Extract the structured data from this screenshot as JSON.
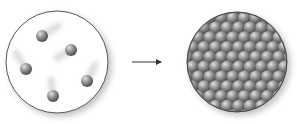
{
  "diagram": {
    "type": "state-transition",
    "colors": {
      "background": "#ffffff",
      "circle_stroke": "#555555",
      "circle_fill_left": "#ffffff",
      "circle_fill_right": "#6f6f6f",
      "particle": "#8a8a8a",
      "arrow": "#333333"
    },
    "left_panel": {
      "label": "",
      "cx": 57,
      "cy": 62,
      "r": 51,
      "particles": [
        {
          "x": 42,
          "y": 36,
          "trail_dx": 16,
          "trail_dy": -10
        },
        {
          "x": 71,
          "y": 50,
          "trail_dx": -14,
          "trail_dy": 8
        },
        {
          "x": 26,
          "y": 69,
          "trail_dx": -10,
          "trail_dy": -16
        },
        {
          "x": 87,
          "y": 81,
          "trail_dx": 8,
          "trail_dy": -16
        },
        {
          "x": 53,
          "y": 96,
          "trail_dx": -2,
          "trail_dy": -16
        }
      ]
    },
    "arrow": {
      "x1": 132,
      "y1": 62,
      "x2": 162,
      "y2": 62
    },
    "right_panel": {
      "label": "",
      "cx": 237,
      "cy": 62,
      "r": 50
    }
  }
}
